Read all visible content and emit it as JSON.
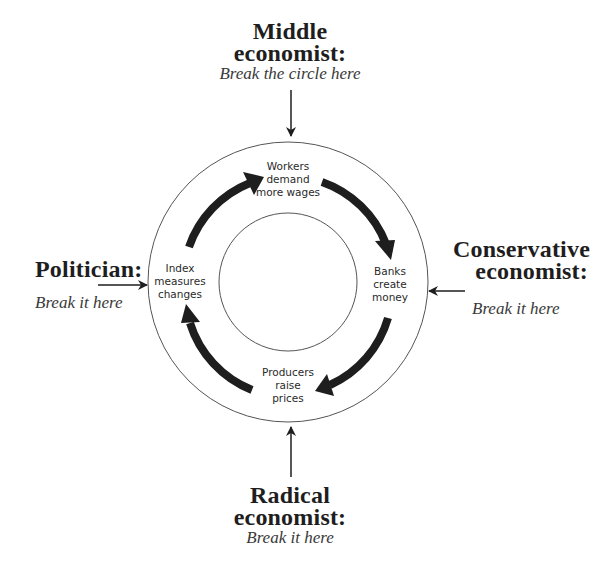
{
  "diagram": {
    "colors": {
      "ink": "#1e1e1e",
      "line": "#555555",
      "background": "#ffffff"
    },
    "nodes": [
      {
        "id": "workers",
        "lines": [
          "Workers",
          "demand",
          "more wages"
        ]
      },
      {
        "id": "banks",
        "lines": [
          "Banks",
          "create",
          "money"
        ]
      },
      {
        "id": "producers",
        "lines": [
          "Producers",
          "raise",
          "prices"
        ]
      },
      {
        "id": "index",
        "lines": [
          "Index",
          "measures",
          "changes"
        ]
      }
    ],
    "cycle_order": [
      "Workers demand more wages",
      "Banks create money",
      "Producers raise prices",
      "Index measures changes"
    ],
    "break_points": {
      "top": {
        "title_lines": [
          "Middle",
          "economist:"
        ],
        "subtitle": "Break the circle here"
      },
      "right": {
        "title_lines": [
          "Conservative",
          "economist:"
        ],
        "subtitle": "Break it here"
      },
      "left": {
        "title_lines": [
          "Politician:"
        ],
        "subtitle": "Break it here"
      },
      "bottom": {
        "title_lines": [
          "Radical",
          "economist:"
        ],
        "subtitle": "Break it here"
      }
    }
  }
}
